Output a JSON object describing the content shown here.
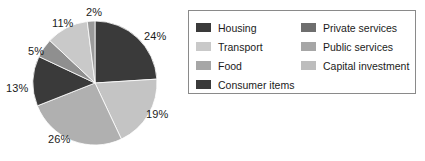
{
  "chart_data": {
    "type": "pie",
    "title": "",
    "labels": [
      "Housing",
      "Transport",
      "Food",
      "Consumer items",
      "Private services",
      "Public services",
      "Capital investment"
    ],
    "values": [
      24,
      19,
      26,
      13,
      5,
      11,
      2
    ],
    "value_labels": [
      "24%",
      "19%",
      "26%",
      "13%",
      "5%",
      "11%",
      "2%"
    ],
    "units": "percent",
    "total": 100,
    "start_angle_deg": 0,
    "direction": "clockwise",
    "legend_position": "right",
    "legend_columns": 2,
    "grid": false,
    "colors": [
      "#3a3a3a",
      "#c4c4c4",
      "#b0b0b0",
      "#3a3a3a",
      "#8f8f8f",
      "#c9c9c9",
      "#9a9a9a"
    ]
  },
  "legend": {
    "border_color": "#8a8a8a",
    "left_column": [
      {
        "label": "Housing",
        "color": "#3a3a3a"
      },
      {
        "label": "Transport",
        "color": "#c9c9c9"
      },
      {
        "label": "Food",
        "color": "#a6a6a6"
      },
      {
        "label": "Consumer items",
        "color": "#3a3a3a"
      }
    ],
    "right_column": [
      {
        "label": "Private services",
        "color": "#6e6e6e"
      },
      {
        "label": "Public services",
        "color": "#a6a6a6"
      },
      {
        "label": "Capital investment",
        "color": "#bdbdbd"
      }
    ]
  },
  "pie_labels": [
    {
      "text": "24%",
      "left": 144,
      "top": 30
    },
    {
      "text": "19%",
      "left": 146,
      "top": 108
    },
    {
      "text": "26%",
      "left": 48,
      "top": 133
    },
    {
      "text": "13%",
      "left": 6,
      "top": 82
    },
    {
      "text": "5%",
      "left": 28,
      "top": 45
    },
    {
      "text": "11%",
      "left": 52,
      "top": 17
    },
    {
      "text": "2%",
      "left": 86,
      "top": 6
    }
  ]
}
